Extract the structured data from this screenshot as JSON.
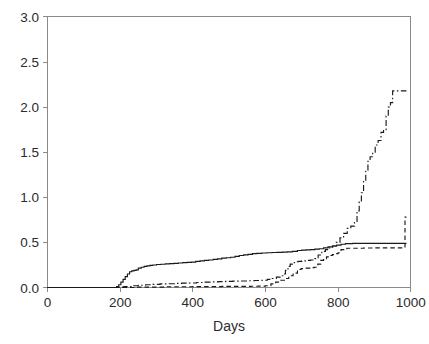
{
  "chart_data": {
    "type": "line",
    "title": "",
    "subtitle": "",
    "xlabel": "Days",
    "ylabel": "",
    "xlim": [
      0,
      1000
    ],
    "ylim": [
      0,
      3.0
    ],
    "grid": false,
    "legend": null,
    "xticks": [
      "0",
      "200",
      "400",
      "600",
      "800",
      "1000"
    ],
    "xtick_values": [
      0,
      200,
      400,
      600,
      800,
      1000
    ],
    "yticks": [
      "0.0",
      "0.5",
      "1.0",
      "1.5",
      "2.0",
      "2.5",
      "3.0"
    ],
    "ytick_values": [
      0.0,
      0.5,
      1.0,
      1.5,
      2.0,
      2.5,
      3.0
    ],
    "annotations": [],
    "step_style": "post",
    "series": [
      {
        "name": "curve-solid",
        "style": "solid",
        "color": "#1a1a1a",
        "x": [
          0,
          140,
          150,
          160,
          170,
          180,
          190,
          196,
          202,
          208,
          214,
          220,
          226,
          232,
          238,
          244,
          250,
          258,
          266,
          274,
          282,
          290,
          300,
          312,
          324,
          336,
          348,
          360,
          372,
          384,
          396,
          408,
          420,
          432,
          444,
          456,
          468,
          480,
          492,
          504,
          516,
          528,
          540,
          552,
          564,
          576,
          590,
          604,
          618,
          632,
          646,
          660,
          674,
          688,
          700,
          712,
          724,
          736,
          748,
          760,
          772,
          784,
          796,
          808,
          820,
          840,
          880,
          920,
          960,
          988
        ],
        "y": [
          0.0,
          0.0,
          0.0,
          0.0,
          0.0,
          0.0,
          0.01,
          0.03,
          0.06,
          0.09,
          0.12,
          0.15,
          0.175,
          0.185,
          0.19,
          0.195,
          0.215,
          0.225,
          0.235,
          0.24,
          0.245,
          0.25,
          0.255,
          0.258,
          0.262,
          0.265,
          0.268,
          0.272,
          0.275,
          0.278,
          0.282,
          0.29,
          0.295,
          0.3,
          0.305,
          0.312,
          0.318,
          0.325,
          0.33,
          0.335,
          0.345,
          0.355,
          0.362,
          0.368,
          0.375,
          0.378,
          0.382,
          0.385,
          0.388,
          0.39,
          0.392,
          0.395,
          0.4,
          0.41,
          0.415,
          0.418,
          0.42,
          0.425,
          0.43,
          0.44,
          0.45,
          0.46,
          0.47,
          0.48,
          0.487,
          0.49,
          0.49,
          0.49,
          0.49,
          0.49
        ]
      },
      {
        "name": "curve-dashdot",
        "style": "dashdot",
        "color": "#1a1a1a",
        "x": [
          0,
          150,
          170,
          190,
          210,
          230,
          250,
          270,
          290,
          310,
          330,
          350,
          370,
          390,
          410,
          430,
          450,
          470,
          490,
          510,
          530,
          550,
          570,
          590,
          605,
          618,
          630,
          640,
          648,
          655,
          662,
          668,
          674,
          680,
          690,
          700,
          712,
          724,
          736,
          745,
          755,
          765,
          775,
          785,
          795,
          805,
          815,
          825,
          835,
          845,
          852,
          858,
          864,
          870,
          876,
          882,
          888,
          895,
          902,
          910,
          918,
          925,
          932,
          938,
          944,
          950,
          960,
          975,
          988
        ],
        "y": [
          0.0,
          0.0,
          0.0,
          0.005,
          0.01,
          0.02,
          0.025,
          0.03,
          0.035,
          0.04,
          0.042,
          0.045,
          0.048,
          0.05,
          0.055,
          0.06,
          0.062,
          0.065,
          0.068,
          0.07,
          0.072,
          0.075,
          0.078,
          0.08,
          0.09,
          0.1,
          0.115,
          0.13,
          0.15,
          0.19,
          0.235,
          0.26,
          0.275,
          0.285,
          0.29,
          0.295,
          0.3,
          0.305,
          0.32,
          0.36,
          0.4,
          0.42,
          0.44,
          0.46,
          0.5,
          0.55,
          0.6,
          0.655,
          0.68,
          0.72,
          0.85,
          0.95,
          1.05,
          1.18,
          1.3,
          1.4,
          1.45,
          1.5,
          1.58,
          1.63,
          1.72,
          1.75,
          1.9,
          2.0,
          2.05,
          2.18,
          2.18,
          2.18,
          2.18
        ]
      },
      {
        "name": "curve-dashed",
        "style": "dashed",
        "color": "#1a1a1a",
        "x": [
          0,
          200,
          240,
          280,
          320,
          360,
          400,
          440,
          480,
          520,
          560,
          580,
          600,
          615,
          628,
          640,
          652,
          664,
          676,
          688,
          698,
          710,
          722,
          734,
          744,
          752,
          760,
          768,
          776,
          784,
          792,
          800,
          808,
          816,
          824,
          840,
          870,
          900,
          930,
          960,
          982,
          984,
          988
        ],
        "y": [
          0.0,
          0.0,
          0.005,
          0.005,
          0.008,
          0.008,
          0.01,
          0.01,
          0.012,
          0.012,
          0.014,
          0.015,
          0.02,
          0.04,
          0.06,
          0.08,
          0.1,
          0.13,
          0.16,
          0.2,
          0.21,
          0.215,
          0.22,
          0.225,
          0.26,
          0.3,
          0.32,
          0.34,
          0.355,
          0.365,
          0.375,
          0.385,
          0.42,
          0.43,
          0.435,
          0.435,
          0.438,
          0.44,
          0.44,
          0.44,
          0.44,
          0.78,
          0.78
        ]
      }
    ]
  }
}
